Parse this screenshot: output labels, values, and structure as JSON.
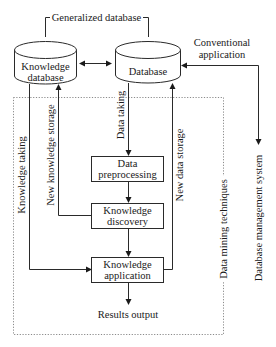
{
  "diagram": {
    "title_bracket": "Generalized database",
    "nodes": {
      "knowledge_database": {
        "line1": "Knowledge",
        "line2": "database"
      },
      "database": {
        "label": "Database"
      },
      "data_preprocessing": {
        "line1": "Data",
        "line2": "preprocessing"
      },
      "knowledge_discovery": {
        "line1": "Knowledge",
        "line2": "discovery"
      },
      "knowledge_application": {
        "line1": "Knowledge",
        "line2": "application"
      },
      "results_output": {
        "label": "Results output"
      }
    },
    "edge_labels": {
      "conventional_application_1": "Conventional",
      "conventional_application_2": "application",
      "knowledge_taking": "Knowledge taking",
      "new_knowledge_storage": "New knowledge storage",
      "data_taking": "Data taking",
      "new_data_storage": "New data storage",
      "data_mining_techniques": "Data mining techniques",
      "database_management_system": "Database management system"
    },
    "colors": {
      "line": "#2a2a2a",
      "dotted_border": "#8a8a8a",
      "background": "#ffffff"
    }
  }
}
